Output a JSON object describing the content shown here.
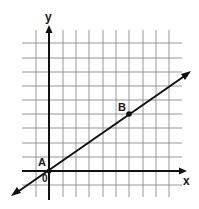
{
  "diagram": {
    "type": "coordinate-plane",
    "axes": {
      "x_label": "x",
      "y_label": "y",
      "origin_label": "0"
    },
    "grid": {
      "x_min": -2,
      "x_max": 10,
      "y_min": -1,
      "y_max": 9
    },
    "line": {
      "through": [
        "A",
        "B"
      ]
    },
    "points": [
      {
        "name": "A",
        "x": 0,
        "y": 0
      },
      {
        "name": "B",
        "x": 6,
        "y": 4
      }
    ],
    "colors": {
      "grid": "#8a8a8a",
      "axis": "#111111",
      "line": "#111111",
      "background": "#ffffff"
    }
  }
}
